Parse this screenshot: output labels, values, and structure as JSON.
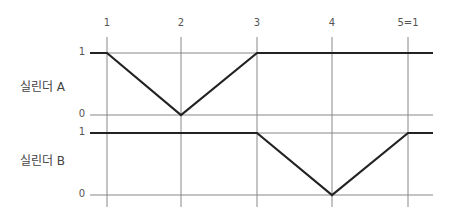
{
  "diagram": {
    "x_ticks": [
      "1",
      "2",
      "3",
      "4",
      "5=1"
    ],
    "cylinders": [
      {
        "label": "실린더 A",
        "y_top_label": "1",
        "y_bottom_label": "0",
        "states": [
          1,
          0,
          1,
          1,
          1
        ]
      },
      {
        "label": "실린더 B",
        "y_top_label": "1",
        "y_bottom_label": "0",
        "states": [
          1,
          1,
          1,
          0,
          1
        ]
      }
    ],
    "colors": {
      "grid": "#888888",
      "signal": "#222222"
    }
  }
}
